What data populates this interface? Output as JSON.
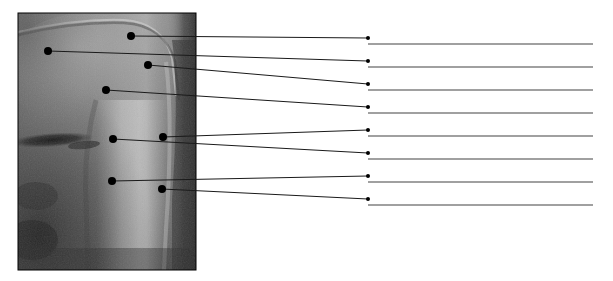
{
  "figure": {
    "kind": "anatomy-labeling-worksheet",
    "title": "",
    "caption": "",
    "background_color": "#ffffff",
    "width": 613,
    "height": 281
  },
  "photo": {
    "name": "grayscale-radiograph-photo",
    "alt_text": "Grayscale radiographic image of anatomical structure",
    "x": 18,
    "y": 13,
    "width": 178,
    "height": 257,
    "border_color": "#000000",
    "tone_dark": "#2a2a2a",
    "tone_mid": "#6e6e6e",
    "tone_light": "#b9b9b9",
    "tone_highlight": "#cfcfcf"
  },
  "style": {
    "marker_color": "#000000",
    "marker_radius": 4,
    "leader_color": "#1a1a1a",
    "leader_width": 1,
    "answer_line_color": "#808080",
    "answer_line_width": 1.4,
    "answer_dot_color": "#000000",
    "answer_dot_radius": 2
  },
  "annotations": [
    {
      "id": 1,
      "label": "",
      "marker_x": 131,
      "marker_y": 36,
      "elbow_x": 368,
      "elbow_y": 38,
      "answer_line_y": 44,
      "answer_line_x1": 368,
      "answer_line_x2": 593
    },
    {
      "id": 2,
      "label": "",
      "marker_x": 48,
      "marker_y": 51,
      "elbow_x": 368,
      "elbow_y": 61,
      "answer_line_y": 67,
      "answer_line_x1": 368,
      "answer_line_x2": 593
    },
    {
      "id": 3,
      "label": "",
      "marker_x": 148,
      "marker_y": 65,
      "elbow_x": 368,
      "elbow_y": 84,
      "answer_line_y": 90,
      "answer_line_x1": 368,
      "answer_line_x2": 593
    },
    {
      "id": 4,
      "label": "",
      "marker_x": 106,
      "marker_y": 90,
      "elbow_x": 368,
      "elbow_y": 107,
      "answer_line_y": 113,
      "answer_line_x1": 368,
      "answer_line_x2": 593
    },
    {
      "id": 5,
      "label": "",
      "marker_x": 163,
      "marker_y": 137,
      "elbow_x": 368,
      "elbow_y": 130,
      "answer_line_y": 136,
      "answer_line_x1": 368,
      "answer_line_x2": 593
    },
    {
      "id": 6,
      "label": "",
      "marker_x": 113,
      "marker_y": 139,
      "elbow_x": 368,
      "elbow_y": 153,
      "answer_line_y": 159,
      "answer_line_x1": 368,
      "answer_line_x2": 593
    },
    {
      "id": 7,
      "label": "",
      "marker_x": 112,
      "marker_y": 181,
      "elbow_x": 368,
      "elbow_y": 176,
      "answer_line_y": 182,
      "answer_line_x1": 368,
      "answer_line_x2": 593
    },
    {
      "id": 8,
      "label": "",
      "marker_x": 162,
      "marker_y": 189,
      "elbow_x": 368,
      "elbow_y": 199,
      "answer_line_y": 205,
      "answer_line_x1": 368,
      "answer_line_x2": 593
    }
  ]
}
